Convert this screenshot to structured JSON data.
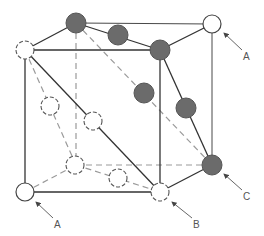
{
  "diagram": {
    "type": "crystal-unit-cell",
    "colors": {
      "line": "#333333",
      "dashed_line": "#999999",
      "filled_atom": "#6b6b6b",
      "filled_atom_stroke": "#555555",
      "open_atom_fill": "#ffffff",
      "open_atom_stroke": "#444444"
    },
    "labels": {
      "a_top_right": "A",
      "a_bottom_left": "A",
      "b": "B",
      "c": "C"
    },
    "atoms": [
      {
        "id": "front-top-left",
        "style": "dashed-open"
      },
      {
        "id": "back-top-left",
        "style": "filled"
      },
      {
        "id": "top-face-center-edge",
        "style": "filled"
      },
      {
        "id": "front-top-right",
        "style": "filled"
      },
      {
        "id": "back-top-right",
        "style": "open",
        "label": "A"
      },
      {
        "id": "back-face-diagonal-center",
        "style": "filled"
      },
      {
        "id": "right-face-edge-mid",
        "style": "filled"
      },
      {
        "id": "back-bottom-right",
        "style": "filled",
        "label": "C"
      },
      {
        "id": "left-face-mid",
        "style": "dashed-open"
      },
      {
        "id": "front-face-diagonal-center",
        "style": "dashed-open"
      },
      {
        "id": "back-bottom-left",
        "style": "dashed-open"
      },
      {
        "id": "bottom-face-mid",
        "style": "dashed-open"
      },
      {
        "id": "front-bottom-left",
        "style": "open",
        "label": "A"
      },
      {
        "id": "front-bottom-right",
        "style": "dashed-open",
        "label": "B"
      }
    ]
  }
}
